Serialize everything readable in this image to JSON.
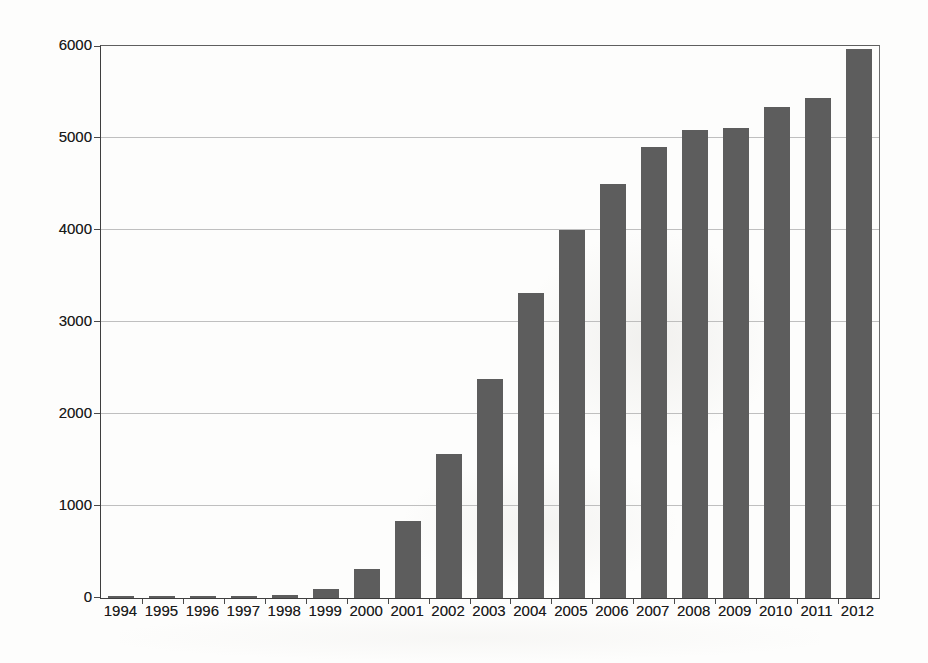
{
  "chart_data": {
    "type": "bar",
    "title": "",
    "xlabel": "",
    "ylabel": "",
    "categories": [
      "1994",
      "1995",
      "1996",
      "1997",
      "1998",
      "1999",
      "2000",
      "2001",
      "2002",
      "2003",
      "2004",
      "2005",
      "2006",
      "2007",
      "2008",
      "2009",
      "2010",
      "2011",
      "2012"
    ],
    "values": [
      20,
      22,
      20,
      22,
      30,
      100,
      310,
      840,
      1570,
      2380,
      3320,
      4000,
      4500,
      4900,
      5090,
      5110,
      5340,
      5440,
      5970
    ],
    "ylim": [
      0,
      6000
    ],
    "yticks": [
      0,
      1000,
      2000,
      3000,
      4000,
      5000,
      6000
    ],
    "ytick_labels": [
      "0",
      "1000",
      "2000",
      "3000",
      "4000",
      "5000",
      "6000"
    ],
    "grid": true,
    "legend": false,
    "colors": {
      "bar_fill": "#5d5d5d",
      "gridline": "#b4b4b4",
      "axis_line": "#3e3e3e",
      "plot_border": "#6e6e6e",
      "label_text": "#1b1b1b",
      "page_background": "#fdfdfc"
    }
  }
}
